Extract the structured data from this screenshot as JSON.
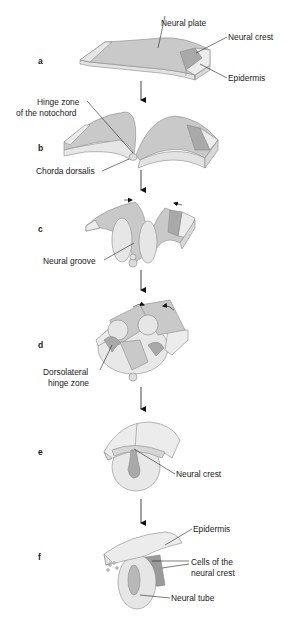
{
  "figure": {
    "colors": {
      "neural_plate": "#c9c9c9",
      "neural_crest": "#a9a9a9",
      "epidermis": "#ececec",
      "side_face": "#e2e2e2",
      "outline": "#8a8a8a",
      "neural_crest_dark": "#9a9a9a",
      "leader": "#222222"
    },
    "panels": [
      {
        "letter": "a",
        "labels": [
          "Neural plate",
          "Neural crest",
          "Epidermis"
        ]
      },
      {
        "letter": "b",
        "labels": [
          "Hinge zone",
          "of the notochord",
          "Chorda dorsalis"
        ]
      },
      {
        "letter": "c",
        "labels": [
          "Neural groove"
        ]
      },
      {
        "letter": "d",
        "labels": [
          "Dorsolateral",
          "hinge zone"
        ]
      },
      {
        "letter": "e",
        "labels": [
          "Neural crest"
        ]
      },
      {
        "letter": "f",
        "labels": [
          "Epidermis",
          "Cells of the",
          "neural crest",
          "Neural tube"
        ]
      }
    ],
    "caption": "(caption text cut off at bottom edge)"
  }
}
